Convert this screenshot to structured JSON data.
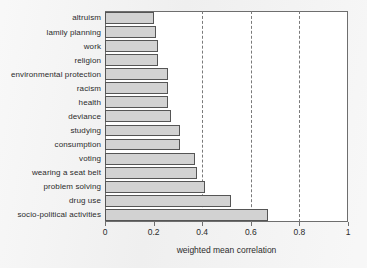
{
  "chart_data": {
    "type": "bar",
    "orientation": "horizontal",
    "title": "",
    "xlabel": "weighted mean correlation",
    "ylabel": "",
    "xlim": [
      0,
      1
    ],
    "xticks": [
      "0",
      "0.2",
      "0.4",
      "0.6",
      "0.8",
      "1"
    ],
    "xtick_values": [
      0,
      0.2,
      0.4,
      0.6,
      0.8,
      1
    ],
    "grid": "vertical dashed gridlines at 0.4, 0.6, 0.8",
    "gridline_values": [
      0.4,
      0.6,
      0.8
    ],
    "legend": "none",
    "categories": [
      "altruism",
      "lamily planning",
      "work",
      "religion",
      "environmental protection",
      "racism",
      "health",
      "deviance",
      "studying",
      "consumption",
      "voting",
      "wearing a seat belt",
      "problem solving",
      "drug use",
      "socio-political activities"
    ],
    "values": [
      0.2,
      0.21,
      0.22,
      0.22,
      0.26,
      0.26,
      0.26,
      0.27,
      0.31,
      0.31,
      0.37,
      0.38,
      0.41,
      0.52,
      0.67
    ],
    "colors": {
      "bar_fill": "#d2d2d2",
      "bar_edge": "#555555",
      "plot_background": "#ffffff",
      "page_background": "#f0f0f0",
      "axis": "#6e6e6e",
      "text": "#2b2b2b",
      "gridline": "#7a7a7a"
    }
  }
}
